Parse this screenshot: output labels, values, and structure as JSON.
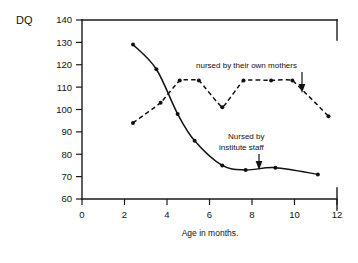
{
  "chart_data": {
    "type": "line",
    "title": "",
    "xlabel": "Age in months.",
    "ylabel": "DQ",
    "xlim": [
      0,
      12
    ],
    "ylim": [
      60,
      140
    ],
    "xticks": [
      "0",
      "2",
      "4",
      "6",
      "8",
      "10",
      "12"
    ],
    "xtick_values": [
      0,
      2,
      4,
      6,
      8,
      10,
      12
    ],
    "yticks": [
      "60",
      "70",
      "80",
      "90",
      "100",
      "110",
      "120",
      "130",
      "140"
    ],
    "ytick_values": [
      60,
      70,
      80,
      90,
      100,
      110,
      120,
      130,
      140
    ],
    "grid": false,
    "legend_position": "inline-annotations",
    "series": [
      {
        "name": "Nursed by institute staff",
        "style": "solid",
        "marker": "dot",
        "x": [
          2.4,
          3.5,
          4.5,
          5.3,
          6.6,
          7.7,
          9.1,
          11.1
        ],
        "values": [
          129,
          118,
          98,
          86,
          75,
          73,
          74,
          71
        ]
      },
      {
        "name": "nursed by their own mothers",
        "style": "dashed",
        "marker": "dot",
        "x": [
          2.4,
          3.7,
          4.6,
          5.5,
          6.6,
          7.6,
          8.9,
          9.9,
          11.6
        ],
        "values": [
          94,
          103,
          113,
          113,
          101,
          113,
          113,
          113,
          97
        ]
      }
    ],
    "annotations": [
      {
        "id": "annotation-mothers",
        "lines": [
          "nursed by their own mothers"
        ],
        "arrow": "down",
        "points_to_series": "nursed by their own mothers"
      },
      {
        "id": "annotation-institute",
        "lines": [
          "Nursed by",
          "institute staff"
        ],
        "arrow": "down",
        "points_to_series": "Nursed by institute staff"
      }
    ]
  }
}
